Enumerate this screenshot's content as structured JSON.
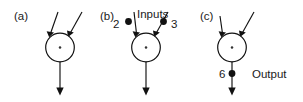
{
  "figure": {
    "background_color": "#ffffff",
    "stroke_color": "#111111",
    "text_color": "#1a1a1a",
    "panels": [
      {
        "tag": "(a)",
        "node_symbol": "·",
        "inputs": [
          {
            "label": "",
            "dot": false
          },
          {
            "label": "",
            "dot": false
          }
        ],
        "output": {
          "label": "",
          "dot": false
        },
        "inputs_caption": "",
        "output_caption": ""
      },
      {
        "tag": "(b)",
        "node_symbol": "·",
        "inputs": [
          {
            "label": "2",
            "dot": true
          },
          {
            "label": "3",
            "dot": true
          }
        ],
        "output": {
          "label": "",
          "dot": false
        },
        "inputs_caption": "Inputs",
        "output_caption": ""
      },
      {
        "tag": "(c)",
        "node_symbol": "·",
        "inputs": [
          {
            "label": "",
            "dot": false
          },
          {
            "label": "",
            "dot": false
          }
        ],
        "output": {
          "label": "6",
          "dot": true
        },
        "inputs_caption": "",
        "output_caption": "Output"
      }
    ]
  }
}
